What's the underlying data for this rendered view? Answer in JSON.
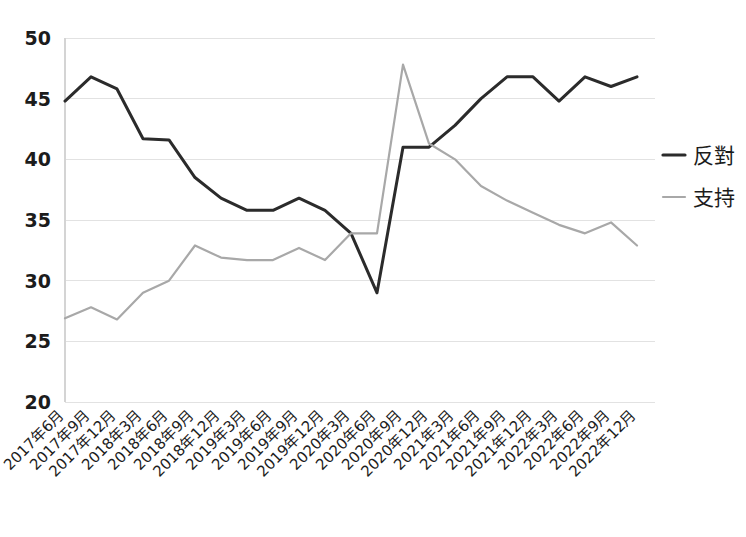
{
  "chart_data": {
    "type": "line",
    "title": "",
    "subtitle": "",
    "xlabel": "",
    "ylabel": "",
    "ylim": [
      20,
      50
    ],
    "yticks": [
      20,
      25,
      30,
      35,
      40,
      45,
      50
    ],
    "grid": true,
    "legend_position": "right",
    "categories": [
      "2017年6月",
      "2017年9月",
      "2017年12月",
      "2018年3月",
      "2018年6月",
      "2018年9月",
      "2018年12月",
      "2019年3月",
      "2019年6月",
      "2019年9月",
      "2019年12月",
      "2020年3月",
      "2020年6月",
      "2020年9月",
      "2020年12月",
      "2021年3月",
      "2021年6月",
      "2021年9月",
      "2021年12月",
      "2022年3月",
      "2022年6月",
      "2022年9月",
      "2022年12月"
    ],
    "series": [
      {
        "name": "反對",
        "color": "#2b2b2b",
        "values": [
          44.8,
          46.8,
          45.8,
          41.7,
          41.6,
          38.5,
          36.8,
          35.8,
          35.8,
          36.8,
          35.8,
          33.9,
          29.0,
          41.0,
          41.0,
          42.8,
          45.0,
          46.8,
          46.8,
          44.8,
          46.8,
          46.0,
          46.8
        ]
      },
      {
        "name": "支持",
        "color": "#a8a8a8",
        "values": [
          26.9,
          27.8,
          26.8,
          29.0,
          30.0,
          32.9,
          31.9,
          31.7,
          31.7,
          32.7,
          31.7,
          33.9,
          33.9,
          47.8,
          41.3,
          40.0,
          37.8,
          36.6,
          35.6,
          34.6,
          33.9,
          34.8,
          32.9
        ]
      }
    ]
  },
  "legend": {
    "items": [
      {
        "label": "反對",
        "color": "#2b2b2b"
      },
      {
        "label": "支持",
        "color": "#a8a8a8"
      }
    ]
  }
}
